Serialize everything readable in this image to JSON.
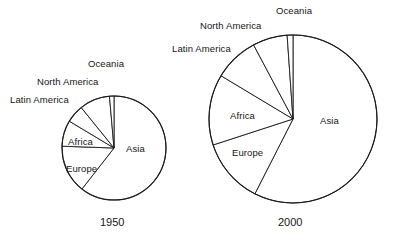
{
  "figure": {
    "background": "#ffffff",
    "stroke_color": "#1a1a1a",
    "fill_color": "#ffffff"
  },
  "charts": [
    {
      "id": "pie-1950",
      "year_label": "1950",
      "center_x": 114,
      "center_y": 148,
      "radius": 52,
      "labels": {
        "asia": "Asia",
        "europe": "Europe",
        "africa": "Africa",
        "latin_america": "Latin America",
        "north_america": "North America",
        "oceania": "Oceania"
      }
    },
    {
      "id": "pie-2000",
      "year_label": "2000",
      "center_x": 293,
      "center_y": 119,
      "radius": 84,
      "labels": {
        "asia": "Asia",
        "europe": "Europe",
        "africa": "Africa",
        "latin_america": "Latin America",
        "north_america": "North America",
        "oceania": "Oceania"
      }
    }
  ],
  "chart_data": [
    {
      "type": "pie",
      "title": "1950",
      "categories": [
        "Asia",
        "Europe",
        "Africa",
        "Latin America",
        "North America",
        "Oceania"
      ],
      "values": [
        60.5,
        15.0,
        8.0,
        5.5,
        9.5,
        1.5
      ],
      "units": "percent of world population",
      "start_angle_deg": 0,
      "direction": "clockwise",
      "legend": "none",
      "labels_inline": true,
      "slice_angles_deg": [
        218,
        54,
        29,
        20,
        34,
        5
      ],
      "annotations": [
        "Asia",
        "Europe",
        "Africa",
        "Latin America",
        "North America",
        "Oceania"
      ]
    },
    {
      "type": "pie",
      "title": "2000",
      "categories": [
        "Asia",
        "Europe",
        "Africa",
        "Latin America",
        "North America",
        "Oceania"
      ],
      "values": [
        60.5,
        12.0,
        13.5,
        8.5,
        5.0,
        0.5
      ],
      "units": "percent of world population",
      "start_angle_deg": 0,
      "direction": "clockwise",
      "legend": "none",
      "labels_inline": true,
      "slice_angles_deg": [
        207,
        45,
        49,
        31,
        24,
        4
      ],
      "annotations": [
        "Asia",
        "Europe",
        "Africa",
        "Latin America",
        "North America",
        "Oceania"
      ]
    }
  ],
  "label_positions_1950": {
    "oceania": {
      "x": 88,
      "y": 58
    },
    "north_america": {
      "x": 37,
      "y": 76
    },
    "latin_america": {
      "x": 10,
      "y": 94
    },
    "africa": {
      "x": 68,
      "y": 136
    },
    "europe": {
      "x": 66,
      "y": 163
    },
    "asia": {
      "x": 126,
      "y": 143
    },
    "year": {
      "x": 100,
      "y": 218
    }
  },
  "label_positions_2000": {
    "oceania": {
      "x": 276,
      "y": 5
    },
    "north_america": {
      "x": 200,
      "y": 20
    },
    "latin_america": {
      "x": 172,
      "y": 43
    },
    "africa": {
      "x": 230,
      "y": 110
    },
    "europe": {
      "x": 232,
      "y": 147
    },
    "asia": {
      "x": 320,
      "y": 115
    },
    "year": {
      "x": 278,
      "y": 218
    }
  }
}
